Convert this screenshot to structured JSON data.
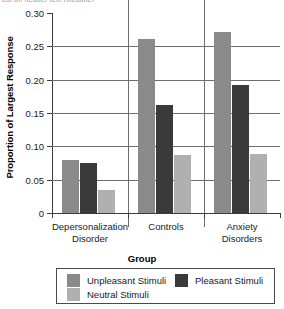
{
  "header": {
    "clipped_text": "cut off header text (illegible)"
  },
  "chart_data": {
    "type": "bar",
    "title": "",
    "xlabel": "Group",
    "ylabel": "Proportion of Largest Response",
    "categories": [
      "Depersonalization\nDisorder",
      "Controls",
      "Anxiety\nDisorders"
    ],
    "ylim": [
      0,
      0.3
    ],
    "yticks": [
      "0",
      "0.05",
      "0.10",
      "0.15",
      "0.20",
      "0.25",
      "0.30"
    ],
    "ytick_values": [
      0,
      0.05,
      0.1,
      0.15,
      0.2,
      0.25,
      0.3
    ],
    "grid": true,
    "legend_position": "bottom",
    "series": [
      {
        "name": "Unpleasant Stimuli",
        "color": "#8a8a8a",
        "values": [
          0.079,
          0.261,
          0.271
        ]
      },
      {
        "name": "Pleasant Stimuli",
        "color": "#3a3a3a",
        "values": [
          0.075,
          0.162,
          0.192
        ]
      },
      {
        "name": "Neutral Stimuli",
        "color": "#b0b0b0",
        "values": [
          0.034,
          0.087,
          0.088
        ]
      }
    ]
  }
}
